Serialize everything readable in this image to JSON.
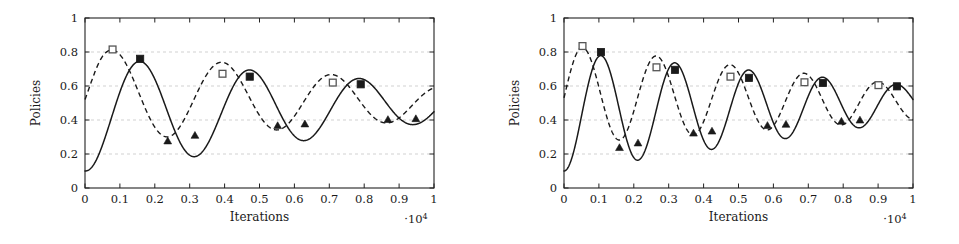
{
  "figure": {
    "background_color": "#ffffff",
    "line_color": "#1a1a1a",
    "grid_color": "#bdbdbd"
  },
  "chart_data": [
    {
      "id": "left",
      "type": "line",
      "title": "",
      "xlabel": "Iterations",
      "ylabel": "Policies",
      "x_exponent_label": "·10",
      "x_exponent_power": "4",
      "xlim": [
        0,
        1
      ],
      "ylim": [
        0,
        1
      ],
      "xticks": [
        0,
        0.1,
        0.2,
        0.3,
        0.4,
        0.5,
        0.6,
        0.7,
        0.8,
        0.9,
        1
      ],
      "xticklabels": [
        "0",
        "0.1",
        "0.2",
        "0.3",
        "0.4",
        "0.5",
        "0.6",
        "0.7",
        "0.8",
        "0.9",
        "1"
      ],
      "yticks": [
        0,
        0.2,
        0.4,
        0.6,
        0.8,
        1
      ],
      "yticklabels": [
        "0",
        "0.2",
        "0.4",
        "0.6",
        "0.8",
        "1"
      ],
      "grid": "horizontal-dashed",
      "legend": "none",
      "series": [
        {
          "name": "solid-series",
          "style": "solid",
          "marker_peak": "filled-square",
          "marker_trough": "triangle",
          "model": {
            "kind": "damped-cosine",
            "start_value": 0.1,
            "baseline_start": 0.43,
            "baseline_end": 0.5,
            "amplitude_start": 0.34,
            "amplitude_end": 0.11,
            "period": 0.315,
            "phase_offset": 0.158
          },
          "markers": [
            {
              "x": 0.158,
              "y": 0.76,
              "type": "filled-square"
            },
            {
              "x": 0.315,
              "y": 0.31,
              "type": "triangle"
            },
            {
              "x": 0.472,
              "y": 0.655,
              "type": "filled-square"
            },
            {
              "x": 0.63,
              "y": 0.377,
              "type": "triangle"
            },
            {
              "x": 0.79,
              "y": 0.61,
              "type": "filled-square"
            },
            {
              "x": 0.948,
              "y": 0.408,
              "type": "triangle"
            }
          ]
        },
        {
          "name": "dashed-series",
          "style": "dashed",
          "marker_peak": "open-square",
          "marker_trough": "triangle",
          "model": {
            "kind": "damped-cosine",
            "start_value": 0.52,
            "baseline_start": 0.55,
            "baseline_end": 0.5,
            "amplitude_start": 0.28,
            "amplitude_end": 0.1,
            "period": 0.315,
            "phase_offset": 0.079
          },
          "markers": [
            {
              "x": 0.079,
              "y": 0.815,
              "type": "open-square"
            },
            {
              "x": 0.237,
              "y": 0.277,
              "type": "triangle"
            },
            {
              "x": 0.394,
              "y": 0.672,
              "type": "open-square"
            },
            {
              "x": 0.552,
              "y": 0.367,
              "type": "triangle"
            },
            {
              "x": 0.71,
              "y": 0.62,
              "type": "open-square"
            },
            {
              "x": 0.868,
              "y": 0.403,
              "type": "triangle"
            }
          ]
        }
      ]
    },
    {
      "id": "right",
      "type": "line",
      "title": "",
      "xlabel": "Iterations",
      "ylabel": "Policies",
      "x_exponent_label": "·10",
      "x_exponent_power": "4",
      "xlim": [
        0,
        1
      ],
      "ylim": [
        0,
        1
      ],
      "xticks": [
        0,
        0.1,
        0.2,
        0.3,
        0.4,
        0.5,
        0.6,
        0.7,
        0.8,
        0.9,
        1
      ],
      "xticklabels": [
        "0",
        "0.1",
        "0.2",
        "0.3",
        "0.4",
        "0.5",
        "0.6",
        "0.7",
        "0.8",
        "0.9",
        "1"
      ],
      "yticks": [
        0,
        0.2,
        0.4,
        0.6,
        0.8,
        1
      ],
      "yticklabels": [
        "0",
        "0.2",
        "0.4",
        "0.6",
        "0.8",
        "1"
      ],
      "grid": "horizontal-dashed",
      "legend": "none",
      "series": [
        {
          "name": "solid-series",
          "style": "solid",
          "marker_peak": "filled-square",
          "marker_trough": "triangle",
          "model": {
            "kind": "damped-cosine",
            "start_value": 0.1,
            "baseline_start": 0.45,
            "baseline_end": 0.5,
            "amplitude_start": 0.35,
            "amplitude_end": 0.1,
            "period": 0.212,
            "phase_offset": 0.106
          },
          "markers": [
            {
              "x": 0.106,
              "y": 0.8,
              "type": "filled-square"
            },
            {
              "x": 0.212,
              "y": 0.265,
              "type": "triangle"
            },
            {
              "x": 0.318,
              "y": 0.695,
              "type": "filled-square"
            },
            {
              "x": 0.424,
              "y": 0.335,
              "type": "triangle"
            },
            {
              "x": 0.53,
              "y": 0.648,
              "type": "filled-square"
            },
            {
              "x": 0.636,
              "y": 0.375,
              "type": "triangle"
            },
            {
              "x": 0.742,
              "y": 0.618,
              "type": "filled-square"
            },
            {
              "x": 0.848,
              "y": 0.4,
              "type": "triangle"
            },
            {
              "x": 0.954,
              "y": 0.598,
              "type": "filled-square"
            }
          ]
        },
        {
          "name": "dashed-series",
          "style": "dashed",
          "marker_peak": "open-square",
          "marker_trough": "triangle",
          "model": {
            "kind": "damped-cosine",
            "start_value": 0.53,
            "baseline_start": 0.55,
            "baseline_end": 0.5,
            "amplitude_start": 0.29,
            "amplitude_end": 0.1,
            "period": 0.212,
            "phase_offset": 0.053
          },
          "markers": [
            {
              "x": 0.053,
              "y": 0.835,
              "type": "open-square"
            },
            {
              "x": 0.159,
              "y": 0.238,
              "type": "triangle"
            },
            {
              "x": 0.265,
              "y": 0.71,
              "type": "open-square"
            },
            {
              "x": 0.371,
              "y": 0.323,
              "type": "triangle"
            },
            {
              "x": 0.477,
              "y": 0.655,
              "type": "open-square"
            },
            {
              "x": 0.583,
              "y": 0.368,
              "type": "triangle"
            },
            {
              "x": 0.689,
              "y": 0.622,
              "type": "open-square"
            },
            {
              "x": 0.795,
              "y": 0.393,
              "type": "triangle"
            },
            {
              "x": 0.901,
              "y": 0.605,
              "type": "open-square"
            }
          ]
        }
      ]
    }
  ]
}
